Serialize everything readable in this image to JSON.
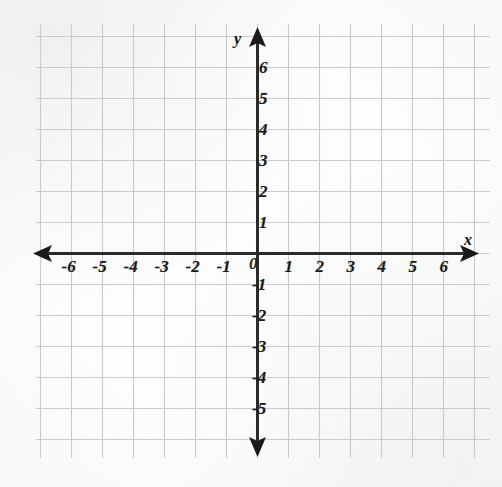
{
  "figure": {
    "kind": "cartesian-coordinate-plane",
    "background_color": "#fdfdfd",
    "grid_color": "#c9c9cc",
    "axis_color": "#2b2b2b",
    "label_color": "#1b1b1b"
  },
  "axes": {
    "x_axis_name": "x",
    "y_axis_name": "y",
    "origin_label": "0",
    "x_arrow_left": "left-arrowhead",
    "x_arrow_right": "right-arrowhead",
    "y_arrow_up": "up-arrowhead",
    "y_arrow_down": "down-arrowhead"
  },
  "chart_data": {
    "type": "scatter",
    "title": "",
    "subtitle": "",
    "xlabel": "x",
    "ylabel": "y",
    "grid": true,
    "legend": "none",
    "xlim": [
      -7,
      7
    ],
    "ylim": [
      -6,
      7
    ],
    "xticks": [
      -6,
      -5,
      -4,
      -3,
      -2,
      -1,
      0,
      1,
      2,
      3,
      4,
      5,
      6
    ],
    "yticks": [
      -5,
      -4,
      -3,
      -2,
      -1,
      0,
      1,
      2,
      3,
      4,
      5,
      6
    ],
    "x_tick_labels": [
      "-6",
      "-5",
      "-4",
      "-3",
      "-2",
      "-1",
      "0",
      "1",
      "2",
      "3",
      "4",
      "5",
      "6"
    ],
    "y_tick_labels": [
      "-5",
      "-4",
      "-3",
      "-2",
      "-1",
      "1",
      "2",
      "3",
      "4",
      "5",
      "6"
    ],
    "grid_step": 1,
    "series": [],
    "values": [],
    "x": [],
    "annotations": []
  },
  "x_labels": [
    {
      "text": "-6",
      "value": -6
    },
    {
      "text": "-5",
      "value": -5
    },
    {
      "text": "-4",
      "value": -4
    },
    {
      "text": "-3",
      "value": -3
    },
    {
      "text": "-2",
      "value": -2
    },
    {
      "text": "-1",
      "value": -1
    },
    {
      "text": "1",
      "value": 1
    },
    {
      "text": "2",
      "value": 2
    },
    {
      "text": "3",
      "value": 3
    },
    {
      "text": "4",
      "value": 4
    },
    {
      "text": "5",
      "value": 5
    },
    {
      "text": "6",
      "value": 6
    }
  ],
  "y_labels": [
    {
      "text": "6",
      "value": 6
    },
    {
      "text": "5",
      "value": 5
    },
    {
      "text": "4",
      "value": 4
    },
    {
      "text": "3",
      "value": 3
    },
    {
      "text": "2",
      "value": 2
    },
    {
      "text": "1",
      "value": 1
    },
    {
      "text": "-1",
      "value": -1
    },
    {
      "text": "-2",
      "value": -2
    },
    {
      "text": "-3",
      "value": -3
    },
    {
      "text": "-4",
      "value": -4
    },
    {
      "text": "-5",
      "value": -5
    }
  ]
}
